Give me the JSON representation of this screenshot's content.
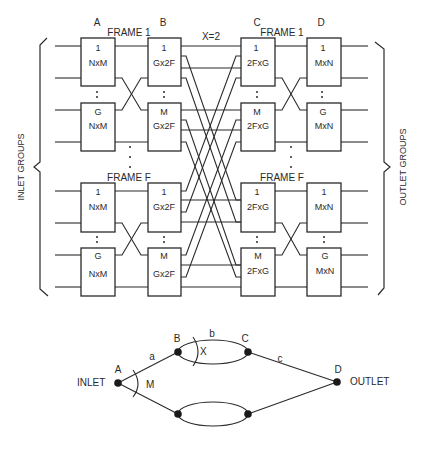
{
  "network": {
    "column_labels": [
      "A",
      "B",
      "C",
      "D"
    ],
    "crossover_label": "X=2",
    "frames": [
      {
        "label": "FRAME 1",
        "stages": {
          "A": [
            {
              "index": "1",
              "type": "NxM"
            },
            {
              "index": "G",
              "type": "NxM"
            }
          ],
          "B": [
            {
              "index": "1",
              "type": "Gx2F"
            },
            {
              "index": "M",
              "type": "Gx2F"
            }
          ],
          "C": [
            {
              "index": "1",
              "type": "2FxG"
            },
            {
              "index": "M",
              "type": "2FxG"
            }
          ],
          "D": [
            {
              "index": "1",
              "type": "MxN"
            },
            {
              "index": "G",
              "type": "MxN"
            }
          ]
        }
      },
      {
        "label": "FRAME F",
        "stages": {
          "A": [
            {
              "index": "1",
              "type": "NxM"
            },
            {
              "index": "G",
              "type": "NxM"
            }
          ],
          "B": [
            {
              "index": "1",
              "type": "Gx2F"
            },
            {
              "index": "M",
              "type": "Gx2F"
            }
          ],
          "C": [
            {
              "index": "1",
              "type": "2FxG"
            },
            {
              "index": "M",
              "type": "2FxG"
            }
          ],
          "D": [
            {
              "index": "1",
              "type": "MxN"
            },
            {
              "index": "G",
              "type": "MxN"
            }
          ]
        }
      }
    ],
    "left_brace_label": "INLET GROUPS",
    "right_brace_label": "OUTLET GROUPS",
    "ellipsis": ":"
  },
  "graph": {
    "nodes": {
      "A": "A",
      "B": "B",
      "C": "C",
      "D": "D"
    },
    "edges": {
      "a": "a",
      "b": "b",
      "c": "c"
    },
    "angle_labels": {
      "M": "M",
      "X": "X"
    },
    "inlet_label": "INLET",
    "outlet_label": "OUTLET"
  },
  "colors": {
    "ink": "#2a2a2a",
    "background": "#ffffff"
  }
}
